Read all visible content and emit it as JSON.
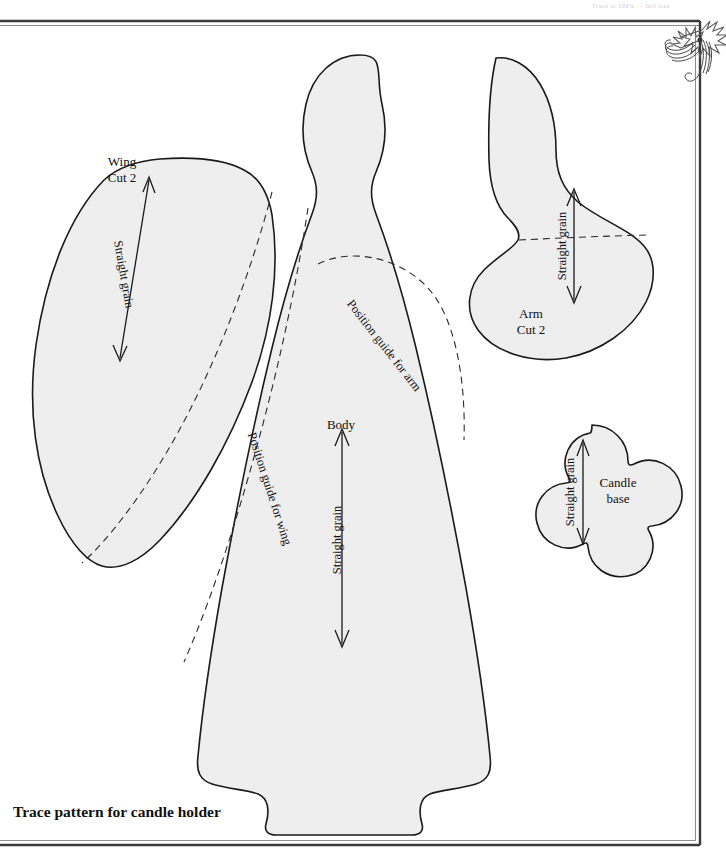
{
  "page": {
    "width": 726,
    "height": 858,
    "background_color": "#ffffff",
    "header_note": "Trace at 100% — full size",
    "caption": "Trace pattern for candle holder"
  },
  "border": {
    "top_rule_color": "#3a3a3a",
    "secondary_rule_color": "#8d8d8d",
    "ornament_name": "ribbon-holly-ornament"
  },
  "pieces": [
    {
      "id": "wing",
      "name": "Wing",
      "cut_label": "Cut 2",
      "grain_label": "Straight grain",
      "fill_color": "#eeeeee",
      "stroke_color": "#1a1a1a"
    },
    {
      "id": "body",
      "name": "Body",
      "cut_label": "",
      "grain_label": "Straight grain",
      "guide_arm": "Position guide for arm",
      "guide_wing": "Position guide for wing",
      "fill_color": "#eeeeee",
      "stroke_color": "#1a1a1a"
    },
    {
      "id": "arm",
      "name": "Arm",
      "cut_label": "Cut 2",
      "grain_label": "Straight grain",
      "fill_color": "#eeeeee",
      "stroke_color": "#1a1a1a"
    },
    {
      "id": "candle-base",
      "name_line1": "Candle",
      "name_line2": "base",
      "grain_label": "Straight grain",
      "fill_color": "#eeeeee",
      "stroke_color": "#1a1a1a"
    }
  ]
}
